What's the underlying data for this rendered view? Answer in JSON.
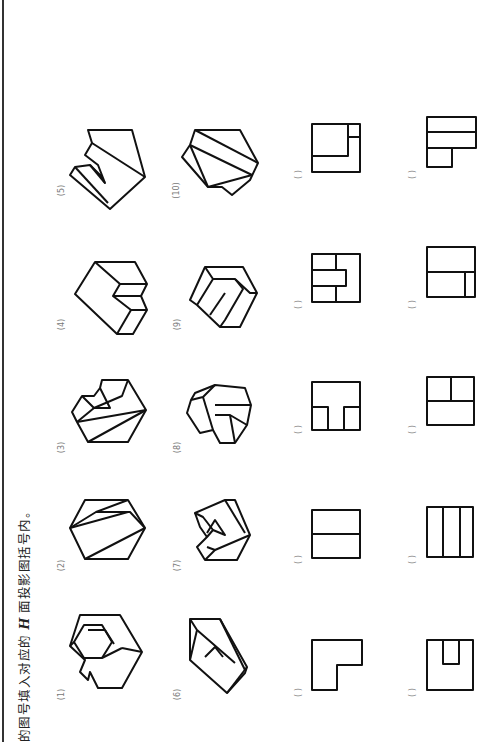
{
  "instruction": {
    "prefix": "的图号填入对应的 ",
    "italic": "H",
    "suffix": " 面投影图括号内。"
  },
  "figures": [
    {
      "label": "(1)"
    },
    {
      "label": "(2)"
    },
    {
      "label": "(3)"
    },
    {
      "label": "(4)"
    },
    {
      "label": "(5)"
    },
    {
      "label": "(6)"
    },
    {
      "label": "(7)"
    },
    {
      "label": "(8)"
    },
    {
      "label": "(9)"
    },
    {
      "label": "(10)"
    }
  ],
  "projections": [
    {
      "answer": "( )"
    },
    {
      "answer": "( )"
    },
    {
      "answer": "( )"
    },
    {
      "answer": "( )"
    },
    {
      "answer": "( )"
    },
    {
      "answer": "( )"
    },
    {
      "answer": "( )"
    },
    {
      "answer": "( )"
    },
    {
      "answer": "( )"
    },
    {
      "answer": "( )"
    }
  ]
}
